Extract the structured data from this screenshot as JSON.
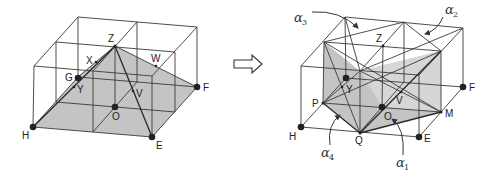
{
  "figure": {
    "left_diagram": {
      "description": "2x2x1 box with shaded pyramid from apex Z over base H-E-F-G",
      "labels": {
        "Z": "Z",
        "X": "X",
        "W": "W",
        "G": "G",
        "Y": "Y",
        "V": "V",
        "O": "O",
        "F": "F",
        "H": "H",
        "E": "E"
      }
    },
    "transform_arrow": {
      "symbol": "⇨"
    },
    "right_diagram": {
      "description": "Same box subdivided by planes alpha1-alpha4",
      "labels": {
        "Z": "Z",
        "Y": "Y",
        "F": "F",
        "P": "P",
        "V": "V",
        "O": "O",
        "M": "M",
        "H": "H",
        "Q": "Q",
        "E": "E"
      },
      "planes": [
        {
          "symbol": "α",
          "subscript": "1"
        },
        {
          "symbol": "α",
          "subscript": "2"
        },
        {
          "symbol": "α",
          "subscript": "3"
        },
        {
          "symbol": "α",
          "subscript": "4"
        }
      ]
    }
  }
}
